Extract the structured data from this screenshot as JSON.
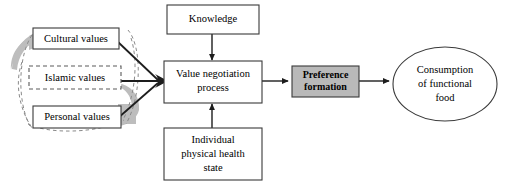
{
  "diagram": {
    "canvas": {
      "width": 507,
      "height": 184,
      "background": "#ffffff"
    },
    "colors": {
      "box_stroke": "#3a3a3a",
      "box_fill": "#ffffff",
      "highlight_fill": "#b9b9b9",
      "shadow_fill": "#bdbdbd",
      "dashed_stroke": "#8a8a8a",
      "edge_stroke": "#1d1d1d",
      "text": "#000000"
    },
    "nodes": [
      {
        "id": "cultural-values",
        "label": "Cultural values",
        "shape": "rect",
        "border": "solid",
        "fill": "white",
        "bold": false,
        "lines": [
          "Cultural values"
        ]
      },
      {
        "id": "islamic-values",
        "label": "Islamic values",
        "shape": "rect",
        "border": "dashed",
        "fill": "white",
        "bold": false,
        "lines": [
          "Islamic values"
        ]
      },
      {
        "id": "personal-values",
        "label": "Personal values",
        "shape": "rect",
        "border": "solid",
        "fill": "white",
        "bold": false,
        "lines": [
          "Personal values"
        ]
      },
      {
        "id": "knowledge",
        "label": "Knowledge",
        "shape": "rect",
        "border": "solid",
        "fill": "white",
        "bold": false,
        "lines": [
          "Knowledge"
        ]
      },
      {
        "id": "value-negotiation-process",
        "label": "Value negotiation process",
        "shape": "rect",
        "border": "solid",
        "fill": "white",
        "bold": false,
        "lines": [
          "Value negotiation",
          "process"
        ]
      },
      {
        "id": "individual-physical-health-state",
        "label": "Individual physical health state",
        "shape": "rect",
        "border": "solid",
        "fill": "white",
        "bold": false,
        "lines": [
          "Individual",
          "physical health",
          "state"
        ]
      },
      {
        "id": "preference-formation",
        "label": "Preference formation",
        "shape": "rect",
        "border": "solid",
        "fill": "gray",
        "bold": true,
        "lines": [
          "Preference",
          "formation"
        ]
      },
      {
        "id": "consumption-of-functional-food",
        "label": "Consumption of functional food",
        "shape": "ellipse",
        "border": "solid",
        "fill": "white",
        "bold": false,
        "lines": [
          "Consumption",
          "of functional",
          "food"
        ]
      }
    ],
    "edges": [
      {
        "from": "cultural-values",
        "to": "value-negotiation-process",
        "style": "solid-arrow"
      },
      {
        "from": "islamic-values",
        "to": "value-negotiation-process",
        "style": "solid-arrow"
      },
      {
        "from": "personal-values",
        "to": "value-negotiation-process",
        "style": "solid-arrow"
      },
      {
        "from": "knowledge",
        "to": "value-negotiation-process",
        "style": "solid-arrow"
      },
      {
        "from": "individual-physical-health-state",
        "to": "value-negotiation-process",
        "style": "solid-arrow"
      },
      {
        "from": "value-negotiation-process",
        "to": "preference-formation",
        "style": "solid-arrow"
      },
      {
        "from": "preference-formation",
        "to": "consumption-of-functional-food",
        "style": "solid-arrow"
      }
    ],
    "decorations": [
      {
        "id": "values-group-shadow",
        "type": "crescent-shadow",
        "note": "gray curved shadow behind the three values boxes"
      },
      {
        "id": "values-group-halo",
        "type": "dashed-enclosure",
        "note": "dashed curved outline enclosing the three values boxes"
      }
    ]
  }
}
